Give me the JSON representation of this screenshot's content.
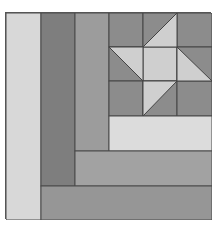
{
  "colors": {
    "light": "#d8d8d8",
    "lighter": "#dcdcdc",
    "dark": "#7e7e7e",
    "medium": "#9c9c9c",
    "star_bg": "#8c8c8c",
    "star_light": "#cfcfcf",
    "line": "#444444",
    "bottom": "#969696"
  },
  "pieces": [
    {
      "name": "left-light-column",
      "color": "light"
    },
    {
      "name": "dark-column",
      "color": "dark"
    },
    {
      "name": "medium-column",
      "color": "medium"
    },
    {
      "name": "light-strip",
      "color": "lighter"
    },
    {
      "name": "medium-bar",
      "color": "medium"
    },
    {
      "name": "bottom-bar",
      "color": "bottom"
    },
    {
      "name": "star-block",
      "grid": "3x3"
    }
  ]
}
